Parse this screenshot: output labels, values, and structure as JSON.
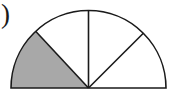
{
  "figure": {
    "kind": "semicircle-sector-diagram",
    "caption_fragment": ")",
    "width": 174,
    "height": 98,
    "background_color": "#ffffff",
    "outline_color": "#1a1a1a",
    "outline_width": 1.6,
    "shaded_color": "#a8a8a8",
    "unshaded_color": "#ffffff",
    "center": {
      "x": 88.5,
      "y": 88
    },
    "radius": 77.5,
    "diameter_endpoints": {
      "left": {
        "x": 11,
        "y": 88
      },
      "right": {
        "x": 166,
        "y": 88
      }
    },
    "apex": {
      "x": 88.5,
      "y": 10.5
    },
    "divider_radii_degrees": [
      45,
      90,
      133
    ],
    "divider_endpoints": [
      {
        "angle": 45,
        "x": 143.3,
        "y": 33.2
      },
      {
        "angle": 90,
        "x": 88.5,
        "y": 10.5
      },
      {
        "angle": 133,
        "x": 35.6,
        "y": 31.3
      }
    ],
    "sectors": [
      {
        "name": "sector-right",
        "start_deg": 0,
        "end_deg": 45,
        "sweep_deg": 45,
        "fill": "#ffffff",
        "shaded": false
      },
      {
        "name": "sector-right-inner",
        "start_deg": 45,
        "end_deg": 90,
        "sweep_deg": 45,
        "fill": "#ffffff",
        "shaded": false
      },
      {
        "name": "sector-left-inner",
        "start_deg": 90,
        "end_deg": 133,
        "sweep_deg": 43,
        "fill": "#ffffff",
        "shaded": false
      },
      {
        "name": "sector-left-shaded",
        "start_deg": 133,
        "end_deg": 180,
        "sweep_deg": 47,
        "fill": "#a8a8a8",
        "shaded": true
      }
    ],
    "sector_count": 4,
    "shaded_sector_count": 1
  }
}
